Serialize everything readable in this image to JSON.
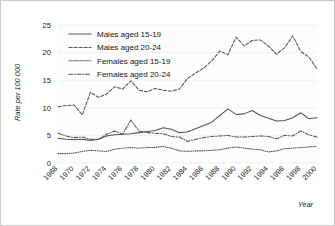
{
  "chart_data": {
    "type": "line",
    "title": "",
    "xlabel": "Year",
    "ylabel": "Rate per 100 000",
    "xlim": [
      1968,
      2000
    ],
    "ylim": [
      0,
      25
    ],
    "yticks": [
      0,
      5,
      10,
      15,
      20,
      25
    ],
    "xticks": [
      1968,
      1970,
      1972,
      1974,
      1976,
      1978,
      1980,
      1982,
      1984,
      1986,
      1988,
      1990,
      1992,
      1994,
      1996,
      1998,
      2000
    ],
    "grid": true,
    "legend_position": "top-left-inside",
    "x": [
      1968,
      1969,
      1970,
      1971,
      1972,
      1973,
      1974,
      1975,
      1976,
      1977,
      1978,
      1979,
      1980,
      1981,
      1982,
      1983,
      1984,
      1985,
      1986,
      1987,
      1988,
      1989,
      1990,
      1991,
      1992,
      1993,
      1994,
      1995,
      1996,
      1997,
      1998,
      1999,
      2000
    ],
    "series": [
      {
        "name": "Males aged 15-19",
        "dash": "solid",
        "values": [
          4.5,
          4.3,
          4.2,
          4.3,
          4.1,
          4.3,
          4.9,
          5.1,
          5.2,
          5.3,
          5.5,
          5.7,
          5.9,
          6.4,
          6.1,
          5.5,
          5.6,
          6.2,
          6.8,
          7.4,
          8.6,
          9.8,
          8.8,
          8.9,
          9.5,
          8.6,
          8.1,
          7.6,
          7.7,
          8.2,
          9.1,
          8.0,
          8.2
        ]
      },
      {
        "name": "Males aged 20-24",
        "dash": "dashed",
        "values": [
          10.2,
          10.4,
          10.5,
          8.7,
          12.8,
          11.9,
          12.5,
          13.8,
          13.4,
          14.9,
          13.2,
          12.9,
          13.5,
          13.2,
          13.0,
          13.4,
          15.3,
          16.3,
          17.2,
          18.5,
          20.3,
          19.6,
          22.8,
          21.2,
          22.2,
          22.3,
          21.2,
          19.7,
          20.9,
          23.0,
          20.2,
          19.2,
          17.0
        ]
      },
      {
        "name": "Females aged 15-19",
        "dash": "dotted",
        "values": [
          1.7,
          1.7,
          1.8,
          2.1,
          2.3,
          2.2,
          2.1,
          2.5,
          2.7,
          2.8,
          2.7,
          2.8,
          2.8,
          3.0,
          2.7,
          2.2,
          2.1,
          2.2,
          2.2,
          2.3,
          2.4,
          2.7,
          2.9,
          2.7,
          2.5,
          2.4,
          2.0,
          2.2,
          2.6,
          2.7,
          2.8,
          2.9,
          3.0
        ]
      },
      {
        "name": "Females aged 20-24",
        "dash": "dashdot",
        "values": [
          5.4,
          4.9,
          4.6,
          4.7,
          4.3,
          4.3,
          5.2,
          5.8,
          5.2,
          7.8,
          5.8,
          5.5,
          5.4,
          5.3,
          4.8,
          4.7,
          3.9,
          4.3,
          4.6,
          4.8,
          4.9,
          5.0,
          4.7,
          4.7,
          4.8,
          4.9,
          4.8,
          4.4,
          5.0,
          4.9,
          5.8,
          5.1,
          4.7
        ]
      }
    ]
  }
}
